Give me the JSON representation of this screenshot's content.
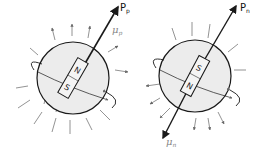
{
  "diagram": {
    "proton": {
      "spin_label": "P",
      "spin_sub": "p",
      "moment_label": "μ",
      "moment_sub": "p",
      "magnet_top_pole": "N",
      "magnet_bottom_pole": "S"
    },
    "neutron": {
      "spin_label": "P",
      "spin_sub": "n",
      "moment_label": "μ",
      "moment_sub": "n",
      "magnet_top_pole": "S",
      "magnet_bottom_pole": "N"
    },
    "colors": {
      "sphere_fill": "#ececec",
      "stroke": "#1a1a1a",
      "field_lines": "#777777",
      "moment_label": "#888888"
    }
  }
}
